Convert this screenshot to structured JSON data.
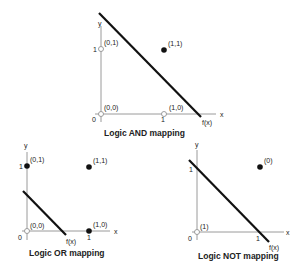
{
  "diagrams": [
    {
      "title": "Logic AND mapping",
      "axis_labels": {
        "x": "x",
        "y": "y",
        "origin": "0",
        "x_tick": "1",
        "y_tick": "1"
      },
      "line_label": "f(x)",
      "points": [
        {
          "label": "(0,0)",
          "filled": false
        },
        {
          "label": "(0,1)",
          "filled": false
        },
        {
          "label": "(1,0)",
          "filled": false
        },
        {
          "label": "(1,1)",
          "filled": true
        }
      ]
    },
    {
      "title": "Logic OR mapping",
      "axis_labels": {
        "x": "x",
        "y": "y",
        "origin": "0",
        "x_tick": "1",
        "y_tick": "1"
      },
      "line_label": "f(x)",
      "points": [
        {
          "label": "(0,0)",
          "filled": false
        },
        {
          "label": "(0,1)",
          "filled": true
        },
        {
          "label": "(1,0)",
          "filled": true
        },
        {
          "label": "(1,1)",
          "filled": true
        }
      ]
    },
    {
      "title": "Logic NOT mapping",
      "axis_labels": {
        "x": "x",
        "y": "y",
        "origin": "0",
        "x_tick": "1",
        "y_tick": "1"
      },
      "line_label": "f(x)",
      "points": [
        {
          "label": "(1)",
          "filled": false
        },
        {
          "label": "(0)",
          "filled": true
        }
      ]
    }
  ],
  "colors": {
    "axis": "#999999",
    "line": "#111111",
    "point": "#111111"
  }
}
